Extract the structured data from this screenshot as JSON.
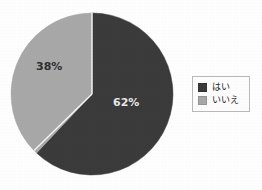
{
  "chart_data": {
    "type": "pie",
    "title": "",
    "subtitle": "",
    "xlabel": "",
    "ylabel": "",
    "grid": false,
    "legend_position": "right",
    "categories": [
      "はい",
      "いいえ"
    ],
    "values": [
      62,
      38
    ],
    "value_unit": "%",
    "start_angle_deg": 0,
    "direction": "clockwise",
    "slices": [
      {
        "label": "はい",
        "value": 62,
        "data_label": "62%",
        "color": "#3a3a3a"
      },
      {
        "label": "いいえ",
        "value": 38,
        "data_label": "38%",
        "color": "#a8a8a8"
      }
    ],
    "legend": [
      {
        "label": "はい",
        "color": "#3a3a3a"
      },
      {
        "label": "いいえ",
        "color": "#a8a8a8"
      }
    ]
  },
  "figure": {
    "background": "#fefefe",
    "pie": {
      "center_x": 92,
      "center_y": 94,
      "radius": 81,
      "outline_color": "#f2f2f2"
    },
    "labels": {
      "no_percent": "38%",
      "yes_percent": "62%"
    }
  },
  "legend_box": {
    "border_color": "#b9b9b9",
    "background": "#fdfdfd",
    "rows": [
      {
        "swatch_color": "#3a3a3a",
        "label": "はい"
      },
      {
        "swatch_color": "#a8a8a8",
        "label": "いいえ"
      }
    ]
  }
}
